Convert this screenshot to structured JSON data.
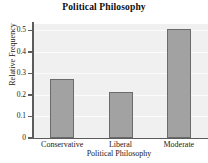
{
  "chart_data": {
    "type": "bar",
    "title": "Political Philosophy",
    "xlabel": "Political Philosophy",
    "ylabel": "Relative Frequency",
    "categories": [
      "Conservative",
      "Liberal",
      "Moderate"
    ],
    "values": [
      0.275,
      0.215,
      0.505
    ],
    "ylim": [
      0,
      0.53
    ],
    "yticks": [
      "0",
      "0.1",
      "0.2",
      "0.3",
      "0.4",
      "0.5"
    ],
    "ytick_values": [
      0,
      0.1,
      0.2,
      0.3,
      0.4,
      0.5
    ],
    "grid": true,
    "legend": false,
    "colors": {
      "bar_fill": "#a2a2a2",
      "bar_edge": "#6b6b6b",
      "plot_background": "#f0f0f0",
      "gridline": "#fbfbfb",
      "axis": "#5c5c5c",
      "text": "#1a1a1a"
    }
  }
}
